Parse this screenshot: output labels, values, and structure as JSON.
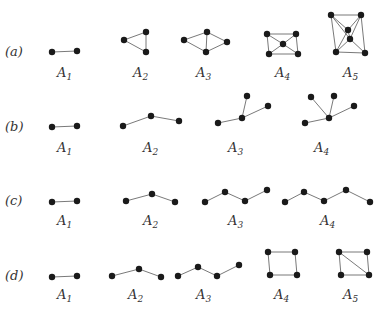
{
  "rows": [
    {
      "label": "(a)",
      "graphs": [
        {
          "name": "A",
          "sub": "1",
          "nodes": [
            [
              52,
              52
            ],
            [
              77,
              51
            ]
          ],
          "edges": [
            [
              0,
              1
            ]
          ]
        },
        {
          "name": "A",
          "sub": "2",
          "nodes": [
            [
              124,
              40
            ],
            [
              146,
              32
            ],
            [
              146,
              52
            ]
          ],
          "edges": [
            [
              0,
              1
            ],
            [
              1,
              2
            ],
            [
              0,
              2
            ]
          ]
        },
        {
          "name": "A",
          "sub": "3",
          "nodes": [
            [
              184,
              40
            ],
            [
              207,
              32
            ],
            [
              227,
              42
            ],
            [
              206,
              52
            ]
          ],
          "edges": [
            [
              0,
              1
            ],
            [
              1,
              2
            ],
            [
              2,
              3
            ],
            [
              3,
              0
            ],
            [
              1,
              3
            ]
          ]
        },
        {
          "name": "A",
          "sub": "4",
          "nodes": [
            [
              267,
              34
            ],
            [
              296,
              34
            ],
            [
              283,
              44
            ],
            [
              269,
              54
            ],
            [
              298,
              54
            ]
          ],
          "edges": [
            [
              0,
              1
            ],
            [
              0,
              3
            ],
            [
              1,
              4
            ],
            [
              3,
              4
            ],
            [
              0,
              2
            ],
            [
              1,
              2
            ],
            [
              2,
              3
            ],
            [
              2,
              4
            ]
          ]
        },
        {
          "name": "A",
          "sub": "5",
          "nodes": [
            [
              331,
              15
            ],
            [
              361,
              15
            ],
            [
              348,
              30
            ],
            [
              350,
              39
            ],
            [
              336,
              52
            ],
            [
              365,
              53
            ]
          ],
          "edges": [
            [
              0,
              1
            ],
            [
              0,
              4
            ],
            [
              1,
              5
            ],
            [
              4,
              5
            ],
            [
              0,
              2
            ],
            [
              1,
              2
            ],
            [
              2,
              3
            ],
            [
              1,
              3
            ],
            [
              3,
              4
            ],
            [
              3,
              5
            ],
            [
              2,
              4
            ],
            [
              0,
              3
            ]
          ]
        }
      ]
    },
    {
      "label": "(b)",
      "graphs": [
        {
          "name": "A",
          "sub": "1",
          "nodes": [
            [
              52,
              127
            ],
            [
              77,
              126
            ]
          ],
          "edges": [
            [
              0,
              1
            ]
          ]
        },
        {
          "name": "A",
          "sub": "2",
          "nodes": [
            [
              123,
              126
            ],
            [
              151,
              116
            ],
            [
              179,
              121
            ]
          ],
          "edges": [
            [
              0,
              1
            ],
            [
              1,
              2
            ]
          ]
        },
        {
          "name": "A",
          "sub": "3",
          "nodes": [
            [
              218,
              123
            ],
            [
              242,
              118
            ],
            [
              247,
              96
            ],
            [
              268,
              106
            ]
          ],
          "edges": [
            [
              0,
              1
            ],
            [
              1,
              2
            ],
            [
              1,
              3
            ]
          ]
        },
        {
          "name": "A",
          "sub": "4",
          "nodes": [
            [
              305,
              123
            ],
            [
              329,
              118
            ],
            [
              311,
              97
            ],
            [
              334,
              96
            ],
            [
              354,
              106
            ]
          ],
          "edges": [
            [
              0,
              1
            ],
            [
              1,
              2
            ],
            [
              1,
              3
            ],
            [
              1,
              4
            ]
          ]
        }
      ]
    },
    {
      "label": "(c)",
      "graphs": [
        {
          "name": "A",
          "sub": "1",
          "nodes": [
            [
              52,
              202
            ],
            [
              77,
              201
            ]
          ],
          "edges": [
            [
              0,
              1
            ]
          ]
        },
        {
          "name": "A",
          "sub": "2",
          "nodes": [
            [
              126,
              201
            ],
            [
              152,
              194
            ],
            [
              175,
              202
            ]
          ],
          "edges": [
            [
              0,
              1
            ],
            [
              1,
              2
            ]
          ]
        },
        {
          "name": "A",
          "sub": "3",
          "nodes": [
            [
              205,
              202
            ],
            [
              225,
              192
            ],
            [
              245,
              201
            ],
            [
              267,
              190
            ]
          ],
          "edges": [
            [
              0,
              1
            ],
            [
              1,
              2
            ],
            [
              2,
              3
            ]
          ]
        },
        {
          "name": "A",
          "sub": "4",
          "nodes": [
            [
              285,
              202
            ],
            [
              304,
              192
            ],
            [
              324,
              201
            ],
            [
              346,
              190
            ],
            [
              370,
              202
            ]
          ],
          "edges": [
            [
              0,
              1
            ],
            [
              1,
              2
            ],
            [
              2,
              3
            ],
            [
              3,
              4
            ]
          ]
        }
      ]
    },
    {
      "label": "(d)",
      "graphs": [
        {
          "name": "A",
          "sub": "1",
          "nodes": [
            [
              52,
              277
            ],
            [
              77,
              276
            ]
          ],
          "edges": [
            [
              0,
              1
            ]
          ]
        },
        {
          "name": "A",
          "sub": "2",
          "nodes": [
            [
              112,
              276
            ],
            [
              139,
              269
            ],
            [
              161,
              277
            ]
          ],
          "edges": [
            [
              0,
              1
            ],
            [
              1,
              2
            ]
          ]
        },
        {
          "name": "A",
          "sub": "3",
          "nodes": [
            [
              178,
              276
            ],
            [
              198,
              267
            ],
            [
              217,
              276
            ],
            [
              239,
              265
            ]
          ],
          "edges": [
            [
              0,
              1
            ],
            [
              1,
              2
            ],
            [
              2,
              3
            ]
          ]
        },
        {
          "name": "A",
          "sub": "4",
          "nodes": [
            [
              268,
              252
            ],
            [
              295,
              252
            ],
            [
              270,
              275
            ],
            [
              297,
              275
            ]
          ],
          "edges": [
            [
              0,
              1
            ],
            [
              0,
              2
            ],
            [
              1,
              3
            ],
            [
              2,
              3
            ]
          ]
        },
        {
          "name": "A",
          "sub": "5",
          "nodes": [
            [
              339,
              252
            ],
            [
              367,
              252
            ],
            [
              341,
              275
            ],
            [
              369,
              275
            ]
          ],
          "edges": [
            [
              0,
              1
            ],
            [
              0,
              2
            ],
            [
              1,
              3
            ],
            [
              2,
              3
            ],
            [
              0,
              3
            ]
          ]
        }
      ]
    }
  ]
}
